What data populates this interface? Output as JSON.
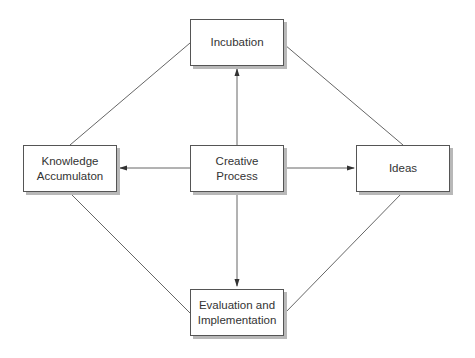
{
  "diagram": {
    "nodes": {
      "incubation": "Incubation",
      "knowledge": "Knowledge\nAccumulaton",
      "creative": "Creative\nProcess",
      "ideas": "Ideas",
      "evaluation": "Evaluation and\nImplementation"
    },
    "edges": [
      {
        "from": "creative",
        "to": "incubation",
        "type": "arrow"
      },
      {
        "from": "creative",
        "to": "knowledge",
        "type": "arrow"
      },
      {
        "from": "creative",
        "to": "ideas",
        "type": "arrow"
      },
      {
        "from": "creative",
        "to": "evaluation",
        "type": "arrow"
      },
      {
        "from": "incubation",
        "to": "knowledge",
        "type": "line"
      },
      {
        "from": "incubation",
        "to": "ideas",
        "type": "line"
      },
      {
        "from": "knowledge",
        "to": "evaluation",
        "type": "line"
      },
      {
        "from": "ideas",
        "to": "evaluation",
        "type": "line"
      }
    ],
    "colors": {
      "stroke": "#555555",
      "shadow": "#b8b8b8",
      "text": "#333333"
    }
  }
}
